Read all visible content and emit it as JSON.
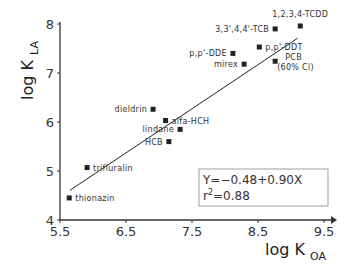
{
  "chart_data": {
    "type": "scatter",
    "title": "",
    "xlabel": "log K_OA",
    "ylabel": "log K_LA",
    "xlim": [
      5.5,
      9.5
    ],
    "ylim": [
      4,
      8
    ],
    "x_ticks": [
      "5.5",
      "6.5",
      "7.5",
      "8.5",
      "9.5"
    ],
    "y_ticks": [
      "4",
      "5",
      "6",
      "7",
      "8"
    ],
    "grid": false,
    "legend": null,
    "points": [
      {
        "label": "thionazin",
        "x": 5.64,
        "y": 4.45
      },
      {
        "label": "trifluralin",
        "x": 5.91,
        "y": 5.07
      },
      {
        "label": "HCB",
        "x": 7.15,
        "y": 5.6
      },
      {
        "label": "lindane",
        "x": 7.32,
        "y": 5.85
      },
      {
        "label": "alfa-HCH",
        "x": 7.1,
        "y": 6.03
      },
      {
        "label": "dieldrin",
        "x": 6.91,
        "y": 6.26
      },
      {
        "label": "mirex",
        "x": 8.29,
        "y": 7.18
      },
      {
        "label": "p,p'-DDE",
        "x": 8.12,
        "y": 7.4
      },
      {
        "label": "p,p'-DDT",
        "x": 8.52,
        "y": 7.53
      },
      {
        "label": "PCB (60% Cl)",
        "x": 8.76,
        "y": 7.24
      },
      {
        "label": "3,3',4,4'-TCB",
        "x": 8.76,
        "y": 7.9
      },
      {
        "label": "1,2,3,4-TCDD",
        "x": 9.14,
        "y": 7.96
      }
    ],
    "regression": {
      "equation": "Y=-0.48+0.90X",
      "r2_label": "r²=0.88",
      "intercept": -0.48,
      "slope": 0.9,
      "r2": 0.88,
      "x_range": [
        5.65,
        9.1
      ]
    }
  },
  "axes": {
    "x_title_main": "log K",
    "x_title_sub": "OA",
    "y_title_main": "log K",
    "y_title_sub": "LA"
  },
  "annotation": {
    "line1": "Y=−0.48+0.90X",
    "line2_main": "r",
    "line2_sup": "2",
    "line2_rest": "=0.88"
  }
}
